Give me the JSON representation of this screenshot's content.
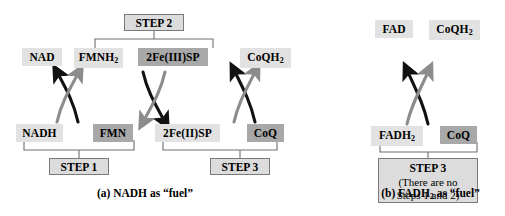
{
  "figure": {
    "title_absent": true,
    "colors": {
      "chip_light": "#e2e2e2",
      "chip_dark": "#a8a8a8",
      "stepbox_fill": "#dcdcdc",
      "stepbox_border": "#7a7a7a",
      "arrow_black": "#111111",
      "arrow_gray": "#8c8c8c",
      "bracket": "#6e6e6e"
    }
  },
  "panel_a": {
    "caption": "(a) NADH as “fuel”",
    "species": {
      "nad": "NAD",
      "fmnh2_text": "FMNH",
      "fmnh2_sub": "2",
      "fe3sp": "2Fe(III)SP",
      "coqh2_text": "CoQH",
      "coqh2_sub": "2",
      "nadh": "NADH",
      "fmn": "FMN",
      "fe2sp": "2Fe(II)SP",
      "coq": "CoQ"
    },
    "steps": {
      "step1": "STEP 1",
      "step2": "STEP 2",
      "step3": "STEP 3"
    }
  },
  "panel_b": {
    "caption_text": "(b) FADH",
    "caption_sub": "2",
    "caption_tail": " as “fuel”",
    "species": {
      "fad": "FAD",
      "coqh2_text": "CoQH",
      "coqh2_sub": "2",
      "fadh2_text": "FADH",
      "fadh2_sub": "2",
      "coq": "CoQ"
    },
    "steps": {
      "step3_title": "STEP 3",
      "step3_line2": "(There are no",
      "step3_line3": "Steps 1 and 2)"
    }
  }
}
